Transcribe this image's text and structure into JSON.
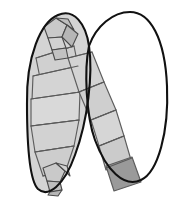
{
  "figure": {
    "caption": "",
    "canvas": {
      "width": 185,
      "height": 207,
      "background": "#ffffff"
    },
    "colors": {
      "background": "#ffffff",
      "outline": "#111111",
      "panel_light": "#d4d4d4",
      "panel_light_alt": "#cfcfcf",
      "panel_mid": "#c6c6c6",
      "panel_end_dark": "#9a9a9a",
      "crease": "#5d5d5d",
      "crumple": "#4a4a4a"
    },
    "stroke_widths": {
      "outline": 2.1,
      "crease": 1.15,
      "crumple": 1.1
    },
    "loops": [
      {
        "name": "left-loop",
        "filled": true,
        "fill": "#d4d4d4",
        "outline_path": "M 27 104 C 26 56 41 22 58 15 C 74 8 86 24 89 46 C 93 74 88 120 75 155 C 64 186 48 198 38 189 C 29 180 27 140 27 104 Z"
      },
      {
        "name": "right-loop",
        "filled": false,
        "fill": "#ffffff",
        "outline_path": "M 89 46 C 96 26 113 12 130 12 C 150 12 165 38 167 86 C 169 132 158 172 141 180 C 124 188 106 170 95 140 C 86 115 84 70 89 46 Z"
      }
    ],
    "panels": [
      {
        "id": "p01",
        "region": "left-upper",
        "fill": "#d0d0d0",
        "points": "36 58, 74 46, 78 66, 40 78"
      },
      {
        "id": "p02",
        "region": "left-upper",
        "fill": "#d4d4d4",
        "points": "33 76, 78 66, 80 92, 32 100"
      },
      {
        "id": "p03",
        "region": "left-middle",
        "fill": "#d9d9d9",
        "points": "31 99, 80 92, 79 120, 31 126"
      },
      {
        "id": "p04",
        "region": "left-middle",
        "fill": "#d2d2d2",
        "points": "31 126, 79 120, 74 146, 35 152"
      },
      {
        "id": "p05",
        "region": "left-lower",
        "fill": "#cdcdcd",
        "points": "35 152, 74 146, 66 170, 43 176"
      },
      {
        "id": "p06",
        "region": "arm-upper",
        "fill": "#d3d3d3",
        "points": "68 58, 92 52, 104 82, 79 92"
      },
      {
        "id": "p07",
        "region": "arm-upper",
        "fill": "#cfcfcf",
        "points": "79 92, 104 82, 116 110, 91 120"
      },
      {
        "id": "p08",
        "region": "arm-middle",
        "fill": "#d6d6d6",
        "points": "91 120, 116 110, 124 136, 99 146"
      },
      {
        "id": "p09",
        "region": "arm-lower",
        "fill": "#cbcbcb",
        "points": "99 146, 124 136, 131 160, 106 170"
      },
      {
        "id": "p10",
        "region": "arm-end",
        "fill": "#9a9a9a",
        "points": "106 166, 132 157, 141 182, 114 191"
      }
    ],
    "creases": [
      {
        "id": "c1",
        "d": "M 36 58 L 74 46"
      },
      {
        "id": "c2",
        "d": "M 33 76 L 78 66"
      },
      {
        "id": "c3",
        "d": "M 31 99 L 80 92"
      },
      {
        "id": "c4",
        "d": "M 31 126 L 79 120"
      },
      {
        "id": "c5",
        "d": "M 35 152 L 74 146"
      },
      {
        "id": "c6",
        "d": "M 43 176 L 66 170"
      },
      {
        "id": "c7",
        "d": "M 68 58 L 92 52"
      },
      {
        "id": "c8",
        "d": "M 79 92 L 104 82"
      },
      {
        "id": "c9",
        "d": "M 91 120 L 116 110"
      },
      {
        "id": "c10",
        "d": "M 99 146 L 124 136"
      },
      {
        "id": "c11",
        "d": "M 106 168 L 132 158"
      }
    ],
    "crumples": [
      {
        "id": "crumple-top",
        "location": "top of left loop",
        "facets": [
          "44 27, 56 18, 67 25, 62 37, 48 38",
          "56 18, 68 19, 74 30, 67 25",
          "48 38, 62 37, 66 48, 52 50",
          "62 37, 67 25, 78 34, 72 47",
          "52 50, 66 48, 68 58, 55 60"
        ]
      },
      {
        "id": "crumple-bottom",
        "location": "bottom of left loop",
        "facets": [
          "43 168, 56 163, 65 171, 60 182, 47 181",
          "47 181, 60 182, 62 190, 50 192",
          "56 163, 67 166, 70 176, 65 171",
          "50 192, 62 190, 58 196, 48 195"
        ]
      }
    ]
  }
}
